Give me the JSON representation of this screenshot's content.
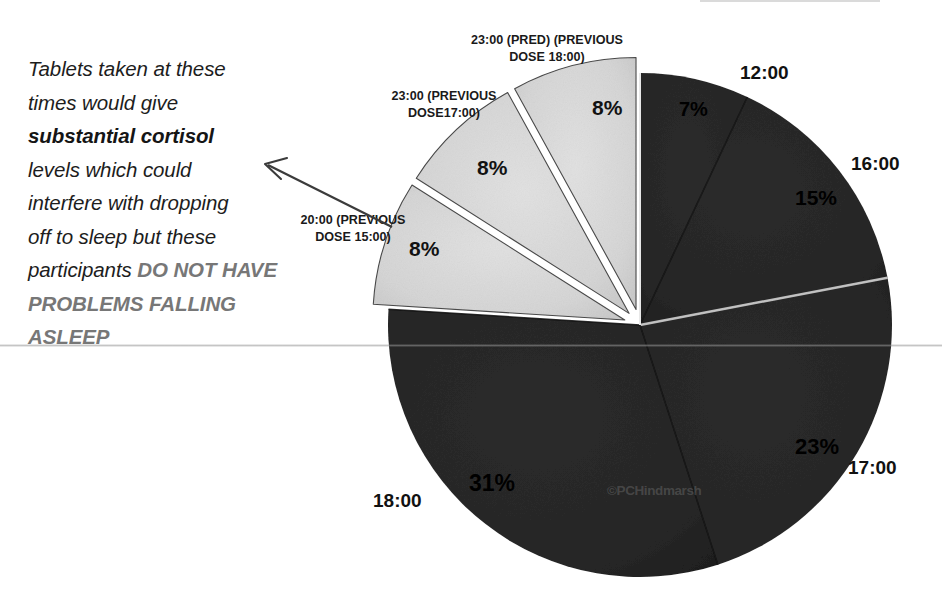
{
  "annotation": {
    "line1": "Tablets taken at these",
    "line2": "times would give",
    "bold_phrase": "substantial cortisol",
    "line3": "levels which could",
    "line4": "interfere with dropping",
    "line5": "off to sleep but these",
    "line6_prefix": "participants ",
    "caps_phrase": "DO NOT HAVE PROBLEMS FALLING ASLEEP"
  },
  "watermark": "©PCHindmarsh",
  "chart_data": {
    "type": "pie",
    "title": "",
    "legend_position": "none",
    "center": {
      "x": 640,
      "y": 325
    },
    "radius": 252,
    "explode_offset": 16,
    "start_angle_deg": 0,
    "direction": "clockwise",
    "colors": {
      "dark_slice": "#262626",
      "light_slice": "#d4d4d4",
      "slice_outline": "#4a4a4a",
      "background": "#ffffff",
      "annotation_text": "#1d1d1d",
      "annotation_caps": "#777777",
      "rule_line": "#969696"
    },
    "categories": [
      "12:00",
      "16:00",
      "17:00",
      "18:00",
      "20:00 (PREVIOUS DOSE 15:00)",
      "23:00 (PREVIOUS DOSE17:00)",
      "23:00 (PRED) (PREVIOUS DOSE 18:00)"
    ],
    "values": [
      7,
      15,
      23,
      31,
      8,
      8,
      8
    ],
    "slices": [
      {
        "id": "s-1200",
        "label": "12:00",
        "pct_text": "7%",
        "value": 7,
        "exploded": false,
        "shade": "dark",
        "time_label_shown": true
      },
      {
        "id": "s-1600",
        "label": "16:00",
        "pct_text": "15%",
        "value": 15,
        "exploded": false,
        "shade": "dark",
        "time_label_shown": true
      },
      {
        "id": "s-1700",
        "label": "17:00",
        "pct_text": "23%",
        "value": 23,
        "exploded": false,
        "shade": "dark",
        "time_label_shown": true
      },
      {
        "id": "s-1800",
        "label": "18:00",
        "pct_text": "31%",
        "value": 31,
        "exploded": false,
        "shade": "dark",
        "time_label_shown": true
      },
      {
        "id": "s-e2",
        "label": "20:00 (PREVIOUS DOSE 15:00)",
        "pct_text": "8%",
        "value": 8,
        "exploded": true,
        "shade": "light",
        "time_label_shown": false
      },
      {
        "id": "s-e1",
        "label": "23:00 (PREVIOUS DOSE17:00)",
        "pct_text": "8%",
        "value": 8,
        "exploded": true,
        "shade": "light",
        "time_label_shown": false
      },
      {
        "id": "s-e0",
        "label": "23:00 (PRED) (PREVIOUS DOSE 18:00)",
        "pct_text": "8%",
        "value": 8,
        "exploded": true,
        "shade": "light",
        "time_label_shown": false
      }
    ],
    "callouts": [
      {
        "id": "callout-0",
        "text": "23:00 (PRED) (PREVIOUS\nDOSE 18:00)"
      },
      {
        "id": "callout-1",
        "text": "23:00 (PREVIOUS\nDOSE17:00)"
      },
      {
        "id": "callout-2",
        "text": "20:00 (PREVIOUS\nDOSE 15:00)"
      }
    ],
    "time_labels": [
      {
        "id": "time-1200",
        "text": "12:00"
      },
      {
        "id": "time-1600",
        "text": "16:00"
      },
      {
        "id": "time-1700",
        "text": "17:00"
      },
      {
        "id": "time-1800",
        "text": "18:00"
      }
    ],
    "pct_labels": [
      {
        "id": "pct-1200",
        "text": "7%"
      },
      {
        "id": "pct-1600",
        "text": "15%"
      },
      {
        "id": "pct-1700",
        "text": "23%"
      },
      {
        "id": "pct-1800",
        "text": "31%"
      },
      {
        "id": "pct-e0",
        "text": "8%"
      },
      {
        "id": "pct-e1",
        "text": "8%"
      },
      {
        "id": "pct-e2",
        "text": "8%"
      }
    ]
  }
}
